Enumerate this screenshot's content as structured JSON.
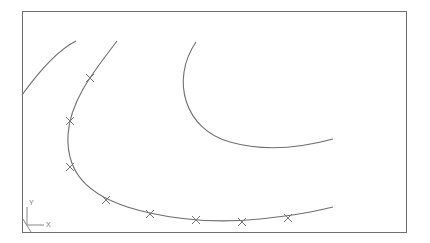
{
  "viewport": {
    "frame": {
      "x": 22,
      "y": 11,
      "width": 384,
      "height": 221
    },
    "stroke_color": "#6e6e6e",
    "background": "#ffffff"
  },
  "ucs_icon": {
    "x_label": "X",
    "y_label": "Y"
  },
  "curves": [
    {
      "name": "curve-left",
      "path": "M22,95 C40,70 58,50 76,41"
    },
    {
      "name": "curve-spline-selected",
      "path": "M117,41 C95,70 70,100 68,135 C66,175 90,200 150,213 C190,222 230,222 260,219 C290,216 310,213 333,207"
    },
    {
      "name": "curve-right",
      "path": "M196,42 C170,80 185,130 230,142 C265,152 300,148 333,139"
    }
  ],
  "control_points": [
    {
      "x": 90,
      "y": 78
    },
    {
      "x": 70,
      "y": 121
    },
    {
      "x": 70,
      "y": 167
    },
    {
      "x": 106,
      "y": 200
    },
    {
      "x": 150,
      "y": 214
    },
    {
      "x": 196,
      "y": 220
    },
    {
      "x": 242,
      "y": 222
    },
    {
      "x": 288,
      "y": 218
    }
  ]
}
